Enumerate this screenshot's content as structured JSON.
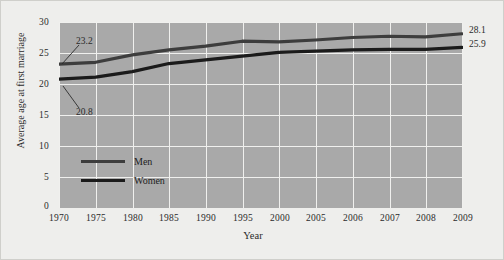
{
  "figure": {
    "background_color": "#eeeeec",
    "plot_background_color": "#a9a9a9",
    "gridline_color": "#f0f0ee",
    "border_color": "#cfcfcb"
  },
  "chart_data": {
    "type": "line",
    "title": "",
    "xlabel": "Year",
    "ylabel": "Average age at first marriage",
    "categories": [
      "1970",
      "1975",
      "1980",
      "1985",
      "1990",
      "1995",
      "2000",
      "2005",
      "2006",
      "2007",
      "2008",
      "2009"
    ],
    "yticks": [
      "0",
      "5",
      "10",
      "15",
      "20",
      "25",
      "30"
    ],
    "ylim": [
      0,
      30
    ],
    "grid": true,
    "legend_position": "inside-lower-left",
    "series": [
      {
        "name": "Men",
        "color": "#3d3d3d",
        "values": [
          23.2,
          23.5,
          24.7,
          25.5,
          26.1,
          26.9,
          26.8,
          27.1,
          27.5,
          27.7,
          27.6,
          28.1
        ],
        "start_label": "23.2",
        "end_label": "28.1"
      },
      {
        "name": "Women",
        "color": "#1b1b1b",
        "values": [
          20.8,
          21.1,
          22.0,
          23.3,
          23.9,
          24.5,
          25.1,
          25.3,
          25.5,
          25.6,
          25.6,
          25.9
        ],
        "start_label": "20.8",
        "end_label": "25.9"
      }
    ],
    "annotations": [
      {
        "text": "23.2",
        "target_series": "Men",
        "target_point": "1970"
      },
      {
        "text": "20.8",
        "target_series": "Women",
        "target_point": "1970"
      },
      {
        "text": "28.1",
        "target_series": "Men",
        "target_point": "2009"
      },
      {
        "text": "25.9",
        "target_series": "Women",
        "target_point": "2009"
      }
    ]
  }
}
